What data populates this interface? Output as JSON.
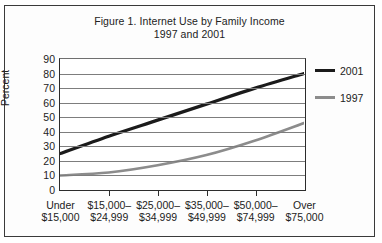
{
  "figure": {
    "title_line1": "Figure 1. Internet Use by Family Income",
    "title_line2": "1997 and 2001"
  },
  "legend": {
    "position": "right",
    "entries": [
      {
        "label": "2001",
        "color": "#1b1b1b",
        "width": 3.2
      },
      {
        "label": "1997",
        "color": "#8c8c8c",
        "width": 2.6
      }
    ]
  },
  "axis": {
    "y_title": "Percent",
    "y_ticks": [
      "90",
      "80",
      "70",
      "60",
      "50",
      "40",
      "30",
      "20",
      "10",
      "0"
    ],
    "x_labels": [
      {
        "line1": "Under",
        "line2": "$15,000"
      },
      {
        "line1": "$15,000–",
        "line2": "$24,999"
      },
      {
        "line1": "$25,000–",
        "line2": "$34,999"
      },
      {
        "line1": "$35,000–",
        "line2": "$49,999"
      },
      {
        "line1": "$50,000–",
        "line2": "$74,999"
      },
      {
        "line1": "Over",
        "line2": "$75,000"
      }
    ]
  },
  "chart_data": {
    "type": "line",
    "title": "Figure 1. Internet Use by Family Income 1997 and 2001",
    "xlabel": "",
    "ylabel": "Percent",
    "ylim": [
      0,
      90
    ],
    "ytick_step": 10,
    "grid": true,
    "legend_position": "right",
    "categories": [
      "Under $15,000",
      "$15,000–$24,999",
      "$25,000–$34,999",
      "$35,000–$49,999",
      "$50,000–$74,999",
      "Over $75,000"
    ],
    "series": [
      {
        "name": "2001",
        "color": "#1b1b1b",
        "values": [
          25,
          37,
          48,
          59,
          70,
          80
        ]
      },
      {
        "name": "1997",
        "color": "#8c8c8c",
        "values": [
          10,
          12,
          17,
          24,
          34,
          46
        ]
      }
    ]
  }
}
